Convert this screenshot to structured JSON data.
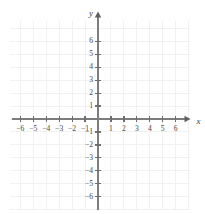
{
  "figure": {
    "kind": "cartesian-coordinate-grid",
    "width": 205,
    "height": 214,
    "background_color": "#ffffff",
    "grid_color": "#f1f1f1",
    "axis_color": "#7d7d7d",
    "label_color": "#4a4a4a"
  },
  "axes": {
    "x": {
      "name": "x",
      "min": -6,
      "max": 6,
      "arrow": "right",
      "tick_labels": [
        "−6",
        "−5",
        "−4",
        "−3",
        "−2",
        "−1",
        "1",
        "2",
        "3",
        "4",
        "5",
        "6"
      ],
      "tick_values": [
        -6,
        -5,
        -4,
        -3,
        -2,
        -1,
        1,
        2,
        3,
        4,
        5,
        6
      ]
    },
    "y": {
      "name": "y",
      "min": -6,
      "max": 6,
      "arrow": "up",
      "tick_labels": [
        "6",
        "5",
        "4",
        "3",
        "2",
        "1",
        "−1",
        "−2",
        "−3",
        "−4",
        "−5",
        "−6"
      ],
      "tick_values": [
        6,
        5,
        4,
        3,
        2,
        1,
        -1,
        -2,
        -3,
        -4,
        -5,
        -6
      ]
    }
  },
  "chart_data": {
    "type": "scatter",
    "title": "",
    "subtitle": "",
    "xlabel": "x",
    "ylabel": "y",
    "xlim": [
      -6.8,
      7.1
    ],
    "ylim": [
      -7.0,
      7.6
    ],
    "xticks": [
      -6,
      -5,
      -4,
      -3,
      -2,
      -1,
      1,
      2,
      3,
      4,
      5,
      6
    ],
    "yticks": [
      -6,
      -5,
      -4,
      -3,
      -2,
      -1,
      1,
      2,
      3,
      4,
      5,
      6
    ],
    "xticklabels": [
      "−6",
      "−5",
      "−4",
      "−3",
      "−2",
      "−1",
      "1",
      "2",
      "3",
      "4",
      "5",
      "6"
    ],
    "yticklabels": [
      "−6",
      "−5",
      "−4",
      "−3",
      "−2",
      "−1",
      "1",
      "2",
      "3",
      "4",
      "5",
      "6"
    ],
    "grid": true,
    "grid_step": 1,
    "legend": false,
    "legend_position": "none",
    "series": [],
    "annotations": [],
    "note": "Empty blank coordinate plane — no data points, curves, or annotations are plotted."
  }
}
